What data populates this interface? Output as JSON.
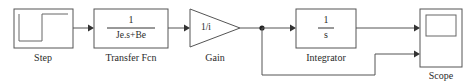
{
  "diagram": {
    "type": "simulink-block-diagram",
    "background_color": "#ffffff",
    "line_color": "#555555",
    "text_color": "#2b2b2b",
    "width": 465,
    "height": 84
  },
  "blocks": {
    "step": {
      "label": "Step",
      "icon": "step-waveform"
    },
    "transfer_fcn": {
      "label": "Transfer Fcn",
      "numerator": "1",
      "denominator": "Je.s+Be"
    },
    "gain": {
      "label": "Gain",
      "value": "1/i"
    },
    "integrator": {
      "label": "Integrator",
      "numerator": "1",
      "denominator": "s"
    },
    "scope": {
      "label": "Scope",
      "icon": "scope-screen"
    }
  },
  "signals": {
    "step_to_transfer": "",
    "transfer_to_gain": "",
    "gain_to_branch": "",
    "branch_to_integrator": "",
    "integrator_to_scope": "",
    "branch_to_scope": ""
  }
}
